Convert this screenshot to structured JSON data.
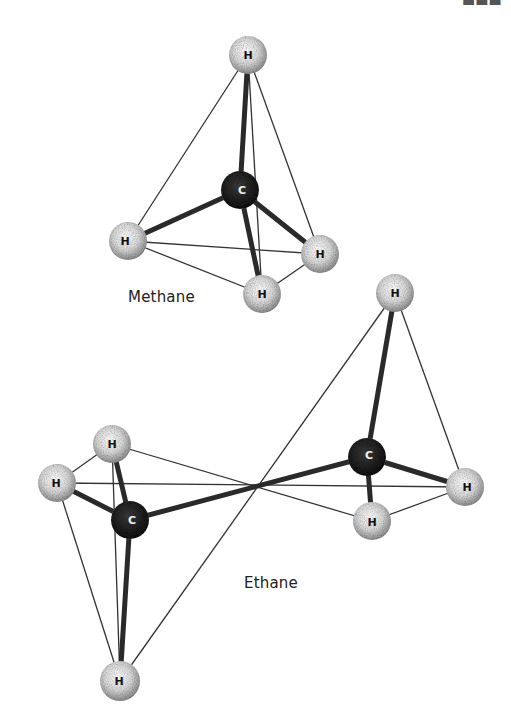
{
  "figure": {
    "methane": {
      "label": "Methane",
      "carbon": {
        "symbol": "C",
        "x": 240,
        "y": 190
      },
      "hydrogens": [
        {
          "symbol": "H",
          "x": 248,
          "y": 55
        },
        {
          "symbol": "H",
          "x": 128,
          "y": 241
        },
        {
          "symbol": "H",
          "x": 320,
          "y": 254
        },
        {
          "symbol": "H",
          "x": 262,
          "y": 294
        }
      ]
    },
    "ethane": {
      "label": "Ethane",
      "carbons": [
        {
          "symbol": "C",
          "x": 130,
          "y": 520
        },
        {
          "symbol": "C",
          "x": 367,
          "y": 457
        }
      ],
      "hydrogens": [
        {
          "symbol": "H",
          "x": 112,
          "y": 444
        },
        {
          "symbol": "H",
          "x": 57,
          "y": 483
        },
        {
          "symbol": "H",
          "x": 120,
          "y": 681
        },
        {
          "symbol": "H",
          "x": 395,
          "y": 293
        },
        {
          "symbol": "H",
          "x": 465,
          "y": 487
        },
        {
          "symbol": "H",
          "x": 372,
          "y": 521
        }
      ]
    }
  },
  "colors": {
    "carbon": "#1c1c1c",
    "hydrogen": "#e8e8e8",
    "line": "#2a2a2a"
  }
}
